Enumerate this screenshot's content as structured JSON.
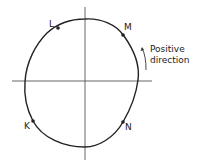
{
  "diagram": {
    "type": "closed-curve-with-axes",
    "axes": {
      "horizontal": true,
      "vertical": true
    },
    "points": [
      {
        "id": "L",
        "label": "L"
      },
      {
        "id": "M",
        "label": "M"
      },
      {
        "id": "N",
        "label": "N"
      },
      {
        "id": "K",
        "label": "K"
      }
    ],
    "annotation": {
      "line1": "Positive",
      "line2": "direction"
    },
    "colors": {
      "stroke": "#222222",
      "background": "#ffffff"
    }
  }
}
